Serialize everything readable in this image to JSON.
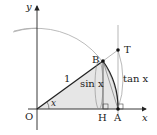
{
  "diagram": {
    "axes": {
      "x_label": "x",
      "y_label": "y"
    },
    "points": {
      "O": "O",
      "A": "A",
      "B": "B",
      "H": "H",
      "T": "T"
    },
    "segment_labels": {
      "radius": "1",
      "sin": "sin x",
      "tan": "tan x",
      "angle": "x"
    },
    "colors": {
      "line": "#222222",
      "arc": "#9a9a9a",
      "shade": "#e6e6e6"
    }
  }
}
